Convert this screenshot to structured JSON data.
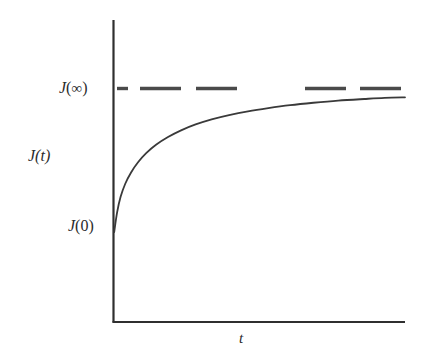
{
  "figure": {
    "title": "",
    "background_color": "#ffffff",
    "line_color": "#3a3a3a",
    "axis_color": "#2f2f2f",
    "text_color": "#2b2b2b"
  },
  "labels": {
    "y_axis_variable": "J(t)",
    "y_axis_variable_symbol": "J",
    "y_axis_variable_arg": "(t)",
    "asymptote": "J(∞)",
    "asymptote_symbol": "J",
    "asymptote_arg_open": "(",
    "asymptote_arg_infinity": "∞",
    "asymptote_arg_close": ")",
    "initial_value": "J(0)",
    "initial_value_symbol": "J",
    "initial_value_arg": "(0)",
    "x_axis_variable": "t"
  },
  "chart_data": {
    "type": "line",
    "title": "",
    "xlabel": "t",
    "ylabel": "J(t)",
    "grid": false,
    "legend": null,
    "xlim": [
      0,
      1
    ],
    "ylim": [
      0,
      1
    ],
    "axis_tick_labels": {
      "x": [],
      "y": []
    },
    "annotations": [
      {
        "text": "J(∞)",
        "type": "y-axis-tick-label",
        "y": 0.745
      },
      {
        "text": "J(0)",
        "type": "y-axis-tick-label",
        "y": 0.299
      },
      {
        "text": "J(t)",
        "type": "y-axis-title",
        "y": 0.55
      },
      {
        "text": "t",
        "type": "x-axis-title",
        "x": 0.44
      }
    ],
    "series": [
      {
        "name": "J(t)",
        "style": "solid",
        "description": "Creep compliance rising monotonically from J(0) and approaching the asymptote J(∞)",
        "x": [
          0.0,
          0.01,
          0.022,
          0.038,
          0.058,
          0.082,
          0.11,
          0.145,
          0.185,
          0.23,
          0.28,
          0.335,
          0.395,
          0.46,
          0.53,
          0.605,
          0.685,
          0.77,
          0.86,
          0.93,
          1.0
        ],
        "y": [
          0.299,
          0.372,
          0.43,
          0.479,
          0.521,
          0.559,
          0.593,
          0.625,
          0.653,
          0.678,
          0.7,
          0.719,
          0.735,
          0.749,
          0.761,
          0.772,
          0.781,
          0.789,
          0.795,
          0.799,
          0.801
        ]
      },
      {
        "name": "J(∞) asymptote",
        "style": "dashed",
        "description": "Horizontal dashed line marking the equilibrium value J(∞)",
        "x": [
          0.0,
          1.0
        ],
        "y": [
          0.836,
          0.836
        ]
      }
    ]
  },
  "geometry": {
    "plot_left_px": 113,
    "plot_right_px": 405,
    "plot_bottom_px": 322,
    "plot_top_px": 20,
    "asymptote_y_px": 88,
    "curve_start_y_px": 232,
    "curve_end_y_px": 101,
    "dash_segments_px": [
      [
        117,
        128
      ],
      [
        140,
        181
      ],
      [
        196,
        237
      ],
      [
        305,
        346
      ],
      [
        360,
        401
      ]
    ]
  }
}
